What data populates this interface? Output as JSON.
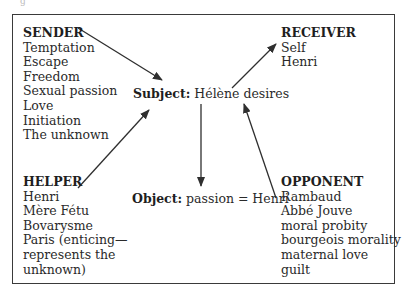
{
  "diagram": {
    "type": "actantial-model",
    "corner_mark": "g",
    "sender": {
      "title": "SENDER",
      "items": [
        "Temptation",
        "Escape",
        "Freedom",
        "Sexual passion",
        "Love",
        "Initiation",
        "The unknown"
      ]
    },
    "receiver": {
      "title": "RECEIVER",
      "items": [
        "Self",
        "Henri"
      ]
    },
    "subject": {
      "label": "Subject:",
      "value": "Hélène desires"
    },
    "object": {
      "label": "Object:",
      "value": "passion = Henri"
    },
    "helper": {
      "title": "HELPER",
      "items": [
        "Henri",
        "Mère Fétu",
        "Bovarysme",
        "Paris (enticing—",
        "represents the",
        "unknown)"
      ]
    },
    "opponent": {
      "title": "OPPONENT",
      "items": [
        "Rambaud",
        "Abbé Jouve",
        "moral probity",
        "bourgeois morality",
        "maternal love",
        "guilt"
      ]
    },
    "arrows": [
      {
        "from": "sender",
        "to": "subject"
      },
      {
        "from": "subject",
        "to": "receiver"
      },
      {
        "from": "helper",
        "to": "subject"
      },
      {
        "from": "subject",
        "to": "object"
      },
      {
        "from": "opponent",
        "to": "subject"
      }
    ],
    "colors": {
      "line": "#2f2f2f",
      "text": "#2a2a2a",
      "border": "#3a3a3a"
    }
  }
}
